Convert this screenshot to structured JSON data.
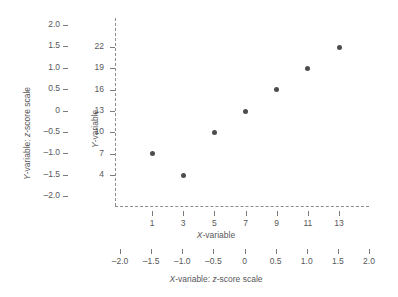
{
  "chart_data": {
    "type": "scatter",
    "title": "",
    "xlabel": "X-variable",
    "ylabel": "Y-variable",
    "x_secondary_label": "X-variable: z-score scale",
    "y_secondary_label": "Y-variable: z-score scale",
    "x": [
      1,
      3,
      5,
      7,
      9,
      11,
      13
    ],
    "values": [
      7,
      4,
      10,
      13,
      16,
      19,
      22
    ],
    "points": [
      {
        "x": 1,
        "y": 7
      },
      {
        "x": 3,
        "y": 4
      },
      {
        "x": 5,
        "y": 10
      },
      {
        "x": 7,
        "y": 13
      },
      {
        "x": 9,
        "y": 16
      },
      {
        "x": 11,
        "y": 19
      },
      {
        "x": 13,
        "y": 22
      }
    ],
    "x_ticks": [
      "1",
      "3",
      "5",
      "7",
      "9",
      "11",
      "13"
    ],
    "y_ticks": [
      "22",
      "19",
      "16",
      "13",
      "10",
      "7",
      "4"
    ],
    "x_zscore_ticks": [
      "-2.0",
      "-1.5",
      "-1.0",
      "-0.5",
      "0",
      "0.5",
      "1.0",
      "1.5",
      "2.0"
    ],
    "y_zscore_ticks": [
      "2.0",
      "1.5",
      "1.0",
      "0.5",
      "0",
      "-0.5",
      "-1.0",
      "-1.5",
      "-2.0"
    ],
    "xlim": [
      0,
      14
    ],
    "ylim": [
      2.5,
      23.5
    ],
    "x_zscore_lim": [
      -2.0,
      2.0
    ],
    "y_zscore_lim": [
      -2.0,
      2.0
    ],
    "grid": false,
    "legend": "none",
    "marker_color": "#4d4d50",
    "axis_color": "#8d8d90",
    "text_color": "#58585a",
    "background": "#ffffff",
    "axis_style": "dashed"
  },
  "labels": {
    "x_title_italic": "X",
    "x_title_rest": "-variable",
    "y_title_italic": "Y",
    "y_title_rest": "-variable",
    "x_z_title_part1_italic": "X",
    "x_z_title_part2": "-variable: ",
    "x_z_title_part3_italic": "z",
    "x_z_title_part4": "-score scale",
    "y_z_title_part1_italic": "Y",
    "y_z_title_part2": "-variable: ",
    "y_z_title_part3_italic": "z",
    "y_z_title_part4": "-score scale"
  }
}
